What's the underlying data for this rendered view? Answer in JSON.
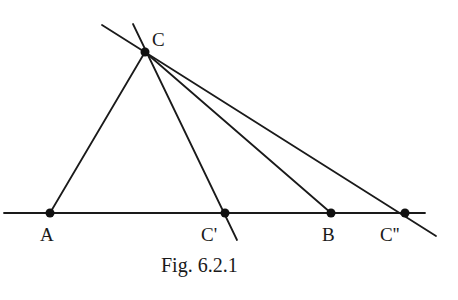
{
  "figure": {
    "caption": "Fig. 6.2.1",
    "stroke_color": "#1a1a1a",
    "background": "#ffffff"
  },
  "points": [
    {
      "id": "A",
      "label": "A",
      "x": 50,
      "y": 213
    },
    {
      "id": "Cp",
      "label": "C'",
      "x": 225,
      "y": 213
    },
    {
      "id": "B",
      "label": "B",
      "x": 331,
      "y": 213
    },
    {
      "id": "Cpp",
      "label": "C''",
      "x": 405,
      "y": 213
    },
    {
      "id": "C",
      "label": "C",
      "x": 145,
      "y": 52
    }
  ],
  "segments": [
    {
      "name": "base-line",
      "from": [
        4,
        213
      ],
      "to": [
        425,
        213
      ]
    },
    {
      "name": "segment-ca",
      "from": [
        145,
        52
      ],
      "to": [
        50,
        213
      ]
    },
    {
      "name": "line-c-cprime",
      "from": [
        133,
        24
      ],
      "to": [
        237,
        240
      ]
    },
    {
      "name": "segment-cb",
      "from": [
        145,
        52
      ],
      "to": [
        331,
        213
      ]
    },
    {
      "name": "line-c-cdoubleprime",
      "from": [
        102,
        25
      ],
      "to": [
        436,
        236
      ]
    }
  ],
  "labels": {
    "A": "A",
    "B": "B",
    "C": "C",
    "Cp": "C'",
    "Cpp": "C''"
  }
}
